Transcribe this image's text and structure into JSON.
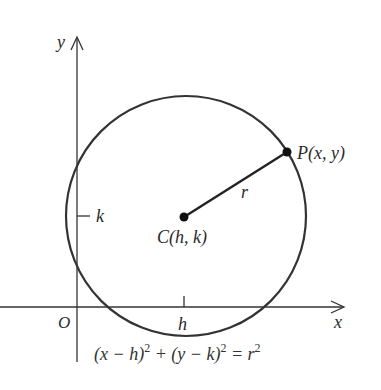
{
  "diagram": {
    "type": "circle-equation",
    "colors": {
      "stroke": "#333333",
      "text": "#2b2b2b",
      "background": "#ffffff"
    },
    "axes": {
      "x_label": "x",
      "y_label": "y",
      "origin_label": "O"
    },
    "ticks": {
      "h_label": "h",
      "k_label": "k"
    },
    "center": {
      "label": "C(h, k)"
    },
    "point": {
      "label": "P(x, y)"
    },
    "radius": {
      "label": "r"
    },
    "equation": {
      "part1": "(x − h)",
      "exp1": "2",
      "plus": " + (y − k)",
      "exp2": "2",
      "equals": " = r",
      "exp3": "2"
    }
  }
}
